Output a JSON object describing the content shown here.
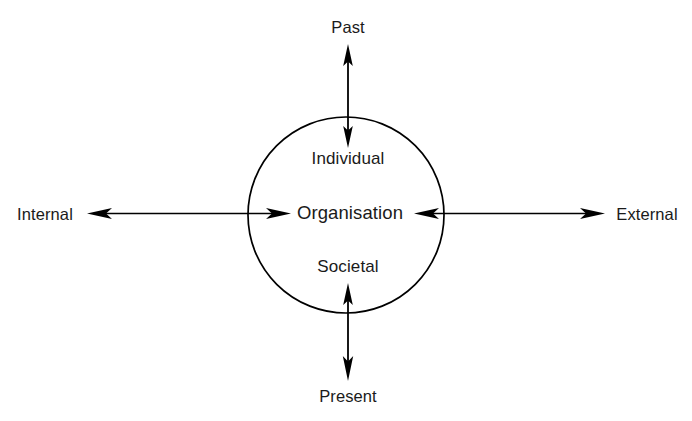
{
  "diagram": {
    "type": "cross-axis-circle",
    "stroke_color": "#000000",
    "text_color": "#1a1a1a",
    "background_color": "#ffffff",
    "circle": {
      "center_x": 346,
      "center_y": 215,
      "radius": 98,
      "fill": "none"
    },
    "axes": [
      {
        "name": "vertical-time-axis",
        "orientation": "vertical",
        "start_label": "Past",
        "end_label": "Present",
        "double_headed": true
      },
      {
        "name": "horizontal-scope-axis",
        "orientation": "horizontal",
        "start_label": "Internal",
        "end_label": "External",
        "double_headed": true
      }
    ],
    "axis_labels": {
      "top": "Past",
      "bottom": "Present",
      "left": "Internal",
      "right": "External"
    },
    "levels": [
      {
        "name": "individual",
        "label": "Individual",
        "position": "upper"
      },
      {
        "name": "organisation",
        "label": "Organisation",
        "position": "center"
      },
      {
        "name": "societal",
        "label": "Societal",
        "position": "lower"
      }
    ]
  }
}
